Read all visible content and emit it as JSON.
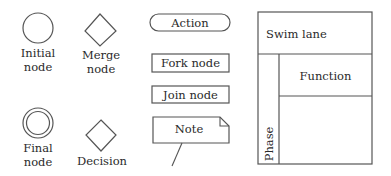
{
  "legend": {
    "initial_node": {
      "label_line1": "Initial",
      "label_line2": "node"
    },
    "merge_node": {
      "label_line1": "Merge",
      "label_line2": "node"
    },
    "final_node": {
      "label_line1": "Final",
      "label_line2": "node"
    },
    "decision": {
      "label": "Decision"
    },
    "action": {
      "label": "Action"
    },
    "fork_node": {
      "label": "Fork node"
    },
    "join_node": {
      "label": "Join node"
    },
    "note": {
      "label": "Note"
    },
    "swimlane": {
      "title": "Swim lane",
      "function": "Function",
      "phase": "Phase"
    }
  },
  "colors": {
    "stroke": "#555555",
    "text": "#2a2a2a",
    "background": "#ffffff"
  }
}
